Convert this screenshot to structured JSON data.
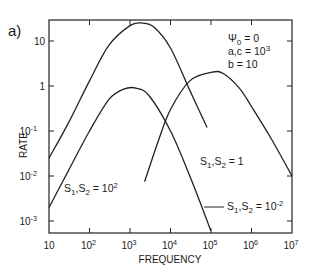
{
  "panel_label": "a)",
  "chart_data": {
    "type": "line",
    "title": "",
    "xlabel": "FREQUENCY",
    "ylabel": "RATE",
    "xscale": "log",
    "yscale": "log",
    "xlim": [
      10,
      10000000
    ],
    "ylim": [
      0.00054,
      29.5
    ],
    "grid": false,
    "x_ticks": [
      {
        "value": 10,
        "base": "10",
        "exp": ""
      },
      {
        "value": 100,
        "base": "10",
        "exp": "2"
      },
      {
        "value": 1000,
        "base": "10",
        "exp": "3"
      },
      {
        "value": 10000,
        "base": "10",
        "exp": "4"
      },
      {
        "value": 100000,
        "base": "10",
        "exp": "5"
      },
      {
        "value": 1000000,
        "base": "10",
        "exp": "6"
      },
      {
        "value": 10000000,
        "base": "10",
        "exp": "7"
      }
    ],
    "y_ticks": [
      {
        "value": 10,
        "base": "10",
        "exp": ""
      },
      {
        "value": 1,
        "base": "1",
        "exp": ""
      },
      {
        "value": 0.1,
        "base": "10",
        "exp": "-1"
      },
      {
        "value": 0.01,
        "base": "10",
        "exp": "-2"
      },
      {
        "value": 0.001,
        "base": "10",
        "exp": "-3"
      }
    ],
    "annotation": {
      "lines": [
        {
          "text": "Ψ₀ = 0",
          "base": "Ψ",
          "sub": "0",
          "rest": " = 0"
        },
        {
          "text": "a,c = 10³",
          "base": "a,c = 10",
          "sup": "3"
        },
        {
          "text": "b = 10"
        }
      ]
    },
    "series": [
      {
        "name": "S1,S2 = 1",
        "label": {
          "pre": "S",
          "s1": "1",
          "mid": ",S",
          "s2": "2",
          "post": " = 1",
          "sup": ""
        },
        "points": [
          [
            10,
            0.025
          ],
          [
            30,
            0.15
          ],
          [
            100,
            1.3
          ],
          [
            300,
            8
          ],
          [
            1000,
            22
          ],
          [
            2000,
            25
          ],
          [
            4000,
            20
          ],
          [
            10000,
            7
          ],
          [
            30000,
            0.8
          ],
          [
            80000,
            0.12
          ]
        ]
      },
      {
        "name": "S1,S2 = 10^-2",
        "label": {
          "pre": "S",
          "s1": "1",
          "mid": ",S",
          "s2": "2",
          "post": " = 10",
          "sup": "-2"
        },
        "points": [
          [
            10,
            0.002
          ],
          [
            30,
            0.013
          ],
          [
            100,
            0.1
          ],
          [
            300,
            0.5
          ],
          [
            700,
            0.85
          ],
          [
            1400,
            0.9
          ],
          [
            3000,
            0.6
          ],
          [
            10000,
            0.1
          ],
          [
            30000,
            0.01
          ],
          [
            100000,
            0.0006
          ]
        ]
      },
      {
        "name": "S1,S2 = 10^2",
        "label": {
          "pre": "S",
          "s1": "1",
          "mid": ",S",
          "s2": "2",
          "post": " = 10",
          "sup": "2"
        },
        "points": [
          [
            2300,
            0.0075
          ],
          [
            5000,
            0.06
          ],
          [
            10000,
            0.3
          ],
          [
            30000,
            1.3
          ],
          [
            100000,
            2.0
          ],
          [
            200000,
            1.9
          ],
          [
            500000,
            0.9
          ],
          [
            1000000,
            0.35
          ],
          [
            3000000,
            0.07
          ],
          [
            10000000,
            0.01
          ]
        ]
      }
    ]
  }
}
